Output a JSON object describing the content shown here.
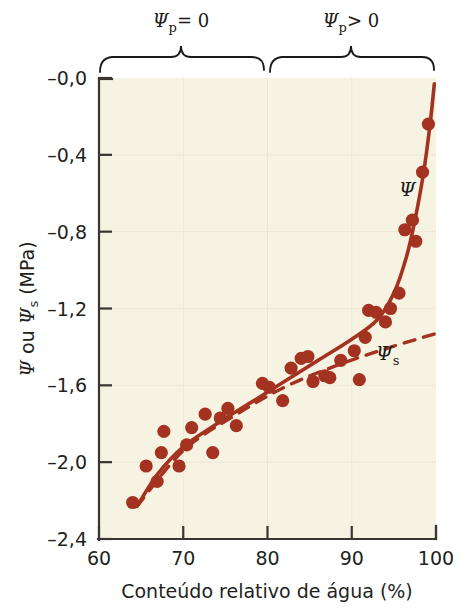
{
  "figure": {
    "background": "#ffffff",
    "plot_background": "#f7f3e3",
    "marker_color": "#a33320",
    "curve_color": "#a33320",
    "axis_color": "#3a3531"
  },
  "annotations": {
    "brace_left_label": "Ψp = 0",
    "brace_left_symbol": "Ψ",
    "brace_left_sub": "p",
    "brace_left_rel": "= 0",
    "brace_right_symbol": "Ψ",
    "brace_right_sub": "p",
    "brace_right_rel": "> 0",
    "curve_psi_label": "Ψ",
    "curve_psi_s_label": "Ψ",
    "curve_psi_s_sub": "s"
  },
  "chart_data": {
    "type": "scatter",
    "title": "",
    "subtitle": "",
    "xlabel": "Conteúdo relativo de água (%)",
    "ylabel_parts": {
      "psi": "Ψ",
      "ou": " ou ",
      "psi_s": "Ψ",
      "psi_s_sub": "s",
      "units": " (MPa)"
    },
    "ylabel": "Ψ ou Ψs (MPa)",
    "xlim": [
      60,
      100
    ],
    "ylim": [
      -2.4,
      0.0
    ],
    "xticks": [
      60,
      70,
      80,
      90,
      100
    ],
    "xtick_labels": [
      "60",
      "70",
      "80",
      "90",
      "100"
    ],
    "yticks": [
      0.0,
      -0.4,
      -0.8,
      -1.2,
      -1.6,
      -2.0,
      -2.4
    ],
    "ytick_labels": [
      "–0,0",
      "–0,4",
      "–0,8",
      "–1,2",
      "–1,6",
      "–2,0",
      "–2,4"
    ],
    "grid": "faint",
    "legend_position": "inline-annotations",
    "points": [
      {
        "x": 64.0,
        "y": -2.21
      },
      {
        "x": 65.6,
        "y": -2.02
      },
      {
        "x": 66.9,
        "y": -2.1
      },
      {
        "x": 67.4,
        "y": -1.95
      },
      {
        "x": 67.7,
        "y": -1.84
      },
      {
        "x": 69.5,
        "y": -2.02
      },
      {
        "x": 70.4,
        "y": -1.91
      },
      {
        "x": 71.0,
        "y": -1.82
      },
      {
        "x": 72.6,
        "y": -1.75
      },
      {
        "x": 73.5,
        "y": -1.95
      },
      {
        "x": 74.4,
        "y": -1.77
      },
      {
        "x": 75.3,
        "y": -1.72
      },
      {
        "x": 76.3,
        "y": -1.81
      },
      {
        "x": 79.4,
        "y": -1.59
      },
      {
        "x": 80.2,
        "y": -1.61
      },
      {
        "x": 81.8,
        "y": -1.68
      },
      {
        "x": 82.8,
        "y": -1.51
      },
      {
        "x": 84.0,
        "y": -1.46
      },
      {
        "x": 84.8,
        "y": -1.45
      },
      {
        "x": 85.4,
        "y": -1.58
      },
      {
        "x": 86.8,
        "y": -1.55
      },
      {
        "x": 87.4,
        "y": -1.56
      },
      {
        "x": 88.7,
        "y": -1.47
      },
      {
        "x": 90.3,
        "y": -1.42
      },
      {
        "x": 90.9,
        "y": -1.57
      },
      {
        "x": 91.6,
        "y": -1.35
      },
      {
        "x": 92.0,
        "y": -1.21
      },
      {
        "x": 92.9,
        "y": -1.22
      },
      {
        "x": 94.0,
        "y": -1.27
      },
      {
        "x": 94.6,
        "y": -1.2
      },
      {
        "x": 95.6,
        "y": -1.12
      },
      {
        "x": 96.3,
        "y": -0.79
      },
      {
        "x": 97.2,
        "y": -0.74
      },
      {
        "x": 97.6,
        "y": -0.85
      },
      {
        "x": 98.4,
        "y": -0.49
      },
      {
        "x": 99.1,
        "y": -0.24
      }
    ],
    "series": [
      {
        "name": "Ψ",
        "style": "solid",
        "color": "#a33320",
        "points": [
          {
            "x": 64.5,
            "y": -2.23
          },
          {
            "x": 67.0,
            "y": -2.06
          },
          {
            "x": 70.0,
            "y": -1.92
          },
          {
            "x": 74.0,
            "y": -1.8
          },
          {
            "x": 78.0,
            "y": -1.69
          },
          {
            "x": 82.0,
            "y": -1.58
          },
          {
            "x": 86.0,
            "y": -1.47
          },
          {
            "x": 90.0,
            "y": -1.36
          },
          {
            "x": 93.0,
            "y": -1.26
          },
          {
            "x": 95.0,
            "y": -1.12
          },
          {
            "x": 96.5,
            "y": -0.93
          },
          {
            "x": 97.5,
            "y": -0.74
          },
          {
            "x": 98.5,
            "y": -0.5
          },
          {
            "x": 99.3,
            "y": -0.24
          },
          {
            "x": 99.8,
            "y": -0.03
          }
        ]
      },
      {
        "name": "Ψs",
        "style": "dashed",
        "color": "#a33320",
        "points": [
          {
            "x": 64.5,
            "y": -2.23
          },
          {
            "x": 70.0,
            "y": -1.94
          },
          {
            "x": 76.0,
            "y": -1.76
          },
          {
            "x": 82.0,
            "y": -1.61
          },
          {
            "x": 88.0,
            "y": -1.5
          },
          {
            "x": 94.0,
            "y": -1.41
          },
          {
            "x": 100.0,
            "y": -1.33
          }
        ]
      }
    ]
  }
}
